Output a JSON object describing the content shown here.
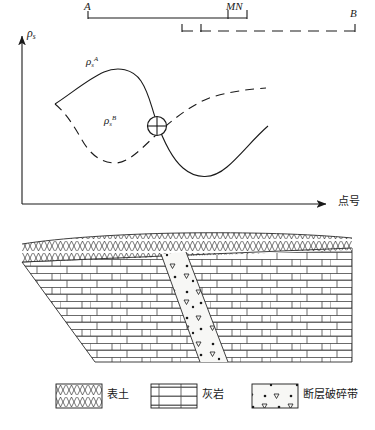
{
  "figure": {
    "title_present": false,
    "electrode_layout": {
      "name": "three-electrode-profiling-layout",
      "labels": {
        "a": "A",
        "mn": "MN",
        "b": "B"
      },
      "segments": [
        {
          "name": "A-to-MN",
          "style": "solid",
          "x1": 88,
          "x2": 247,
          "y": 18
        },
        {
          "name": "MN-to-B",
          "style": "dashed",
          "x1": 182,
          "x2": 355,
          "y": 31
        }
      ],
      "ticks": [
        {
          "name": "tick-A",
          "x": 88,
          "y": 18
        },
        {
          "name": "tick-M",
          "x": 228,
          "y": 18
        },
        {
          "name": "tick-N",
          "x": 247,
          "y": 18
        },
        {
          "name": "tick-M2",
          "x": 182,
          "y": 31
        },
        {
          "name": "tick-N2",
          "x": 201,
          "y": 31
        },
        {
          "name": "tick-B",
          "x": 355,
          "y": 31
        }
      ]
    },
    "axes": {
      "y_label_symbol": "ρ",
      "y_label_sub": "s",
      "x_label": "点号",
      "origin": {
        "x": 22,
        "y": 204
      },
      "y_top": {
        "x": 22,
        "y": 34
      },
      "x_right": {
        "x": 330,
        "y": 204
      }
    },
    "curves": [
      {
        "name": "rho-s-A",
        "label_symbol": "ρ",
        "label_sub": "s",
        "label_sup": "A",
        "style": "solid",
        "label_pos": {
          "x": 86,
          "y": 58
        },
        "path": "M 55,104 C 75,92 90,80 105,72 C 120,64 134,68 142,80 C 150,92 152,104 157,118 C 163,134 170,156 183,168 C 196,180 212,180 226,168 C 240,156 252,140 268,126"
      },
      {
        "name": "rho-s-B",
        "label_symbol": "ρ",
        "label_sub": "s",
        "label_sup": "B",
        "style": "dashed",
        "label_pos": {
          "x": 104,
          "y": 117
        },
        "path": "M 55,104 C 66,112 74,126 82,140 C 90,154 100,162 114,163 C 128,164 142,148 157,134 C 172,120 192,104 212,98 C 232,92 252,90 266,88"
      }
    ],
    "intersection_marker": {
      "name": "intersection-point",
      "symbol": "circle-plus",
      "x": 157,
      "y": 126,
      "r": 9.5
    },
    "cross_section": {
      "name": "geologic-cross-section",
      "layers": [
        {
          "name": "topsoil-layer",
          "legend_key": "topsoil"
        },
        {
          "name": "limestone-layer",
          "legend_key": "limestone"
        },
        {
          "name": "fault-zone-layer",
          "legend_key": "fault_zone"
        }
      ]
    },
    "legend": {
      "name": "legend",
      "items": [
        {
          "name": "legend-item-topsoil",
          "key": "topsoil",
          "label": "表土",
          "pattern": "zigzag-x",
          "swatch": {
            "x": 56,
            "y": 384,
            "w": 46,
            "h": 24
          }
        },
        {
          "name": "legend-item-limestone",
          "key": "limestone",
          "label": "灰岩",
          "pattern": "brick",
          "swatch": {
            "x": 151,
            "y": 384,
            "w": 46,
            "h": 24
          }
        },
        {
          "name": "legend-item-fault-zone",
          "key": "fault_zone",
          "label": "断层破碎带",
          "pattern": "dots-triangles",
          "swatch": {
            "x": 252,
            "y": 384,
            "w": 46,
            "h": 24
          }
        }
      ]
    },
    "colors": {
      "ink": "#1a1a1a",
      "background": "#ffffff",
      "fault_fill": "#f5f5f3"
    }
  }
}
